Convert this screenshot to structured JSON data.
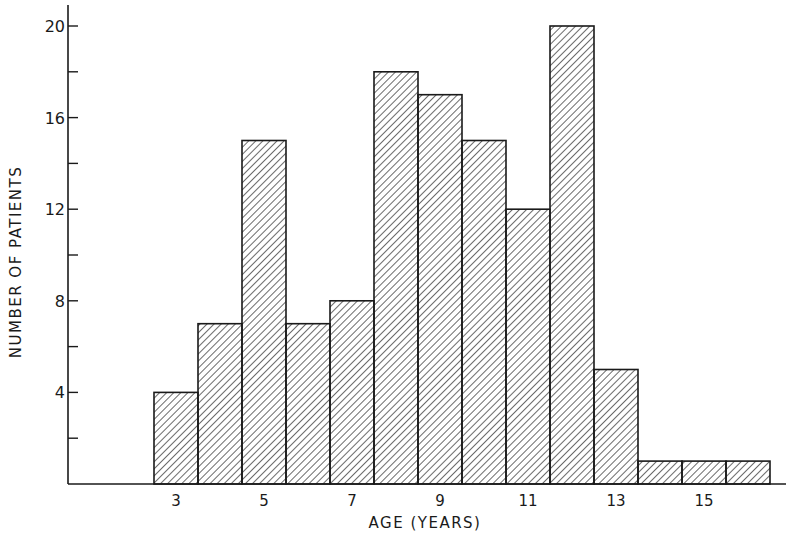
{
  "chart_data": {
    "type": "bar",
    "title": "",
    "xlabel": "AGE (YEARS)",
    "ylabel": "NUMBER OF PATIENTS",
    "categories": [
      3,
      4,
      5,
      6,
      7,
      8,
      9,
      10,
      11,
      12,
      13,
      14,
      15,
      16
    ],
    "values": [
      4,
      7,
      15,
      7,
      8,
      18,
      17,
      15,
      12,
      20,
      5,
      1,
      1,
      1
    ],
    "x_tick_labels": [
      "3",
      "5",
      "7",
      "9",
      "11",
      "13",
      "15"
    ],
    "y_tick_labels": [
      "4",
      "8",
      "12",
      "16",
      "20"
    ],
    "y_minor_ticks": [
      2,
      6,
      10,
      14,
      18
    ],
    "ylim": [
      0,
      21
    ],
    "grid": false,
    "legend": null,
    "fill": "diagonal-hatch",
    "colors": {
      "line": "#1a1a1a",
      "background": "#ffffff"
    }
  },
  "labels": {
    "x_axis": "AGE (YEARS)",
    "y_axis": "NUMBER OF PATIENTS"
  }
}
